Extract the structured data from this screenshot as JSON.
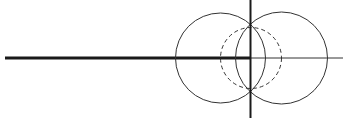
{
  "diagram": {
    "type": "geometric-construction",
    "colors": {
      "background": "#ffffff",
      "stroke": "#333333",
      "axis": "#1a1a1a"
    },
    "elements": {
      "thick_horizontal_line": {
        "x1": 5,
        "y1": 58,
        "x2": 250.5,
        "y2": 58,
        "width": 3
      },
      "thin_horizontal_line": {
        "x1": 250.5,
        "y1": 58,
        "x2": 343,
        "y2": 58,
        "width": 1
      },
      "vertical_line": {
        "x1": 250.5,
        "y1": 0,
        "x2": 250.5,
        "y2": 118,
        "width": 2
      },
      "left_circle": {
        "cx": 220.5,
        "cy": 58,
        "r": 45,
        "style": "solid"
      },
      "right_circle": {
        "cx": 281.5,
        "cy": 58,
        "r": 46,
        "style": "solid"
      },
      "dashed_circle": {
        "cx": 251,
        "cy": 58,
        "r": 30.5,
        "style": "dashed"
      }
    }
  }
}
